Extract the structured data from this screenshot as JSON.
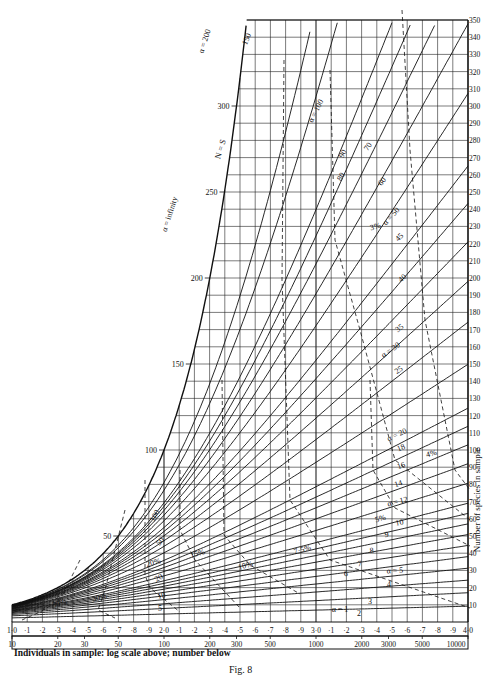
{
  "chart_data": {
    "type": "line",
    "title": "Fig. 8",
    "xlabel": "Individuals in sample: log scale above; number below",
    "ylabel": "Number of species in sample",
    "x_log_ticks": [
      "1·0",
      "·1",
      "·2",
      "·3",
      "·4",
      "·5",
      "·6",
      "·7",
      "·8",
      "·9",
      "2·0",
      "·1",
      "·2",
      "·3",
      "·4",
      "·5",
      "·6",
      "·7",
      "·8",
      "·9",
      "3·0",
      "·1",
      "·2",
      "·3",
      "·4",
      "·5",
      "·6",
      "·7",
      "·8",
      "·9",
      "4·0"
    ],
    "x_number_ticks": [
      10,
      20,
      30,
      50,
      100,
      200,
      300,
      500,
      1000,
      2000,
      3000,
      5000,
      10000
    ],
    "y_ticks_right": [
      10,
      20,
      30,
      40,
      50,
      60,
      70,
      80,
      90,
      100,
      110,
      120,
      130,
      140,
      150,
      160,
      170,
      180,
      190,
      200,
      210,
      220,
      230,
      240,
      250,
      260,
      270,
      280,
      290,
      300,
      310,
      320,
      330,
      340,
      350
    ],
    "y_ticks_left": [
      50,
      100,
      150,
      200,
      250,
      300
    ],
    "xlim_log": [
      1.0,
      4.0
    ],
    "ylim": [
      0,
      350
    ],
    "grid": true,
    "series": [
      {
        "name": "N = S",
        "alpha": "infinity"
      },
      {
        "name": "α = 200",
        "alpha": 200
      },
      {
        "name": "150",
        "alpha": 150
      },
      {
        "name": "α = 100",
        "alpha": 100
      },
      {
        "name": "90",
        "alpha": 90
      },
      {
        "name": "80",
        "alpha": 80
      },
      {
        "name": "70",
        "alpha": 70
      },
      {
        "name": "60",
        "alpha": 60
      },
      {
        "name": "α = 50",
        "alpha": 50
      },
      {
        "name": "45",
        "alpha": 45
      },
      {
        "name": "40",
        "alpha": 40
      },
      {
        "name": "35",
        "alpha": 35
      },
      {
        "name": "α = 30",
        "alpha": 30
      },
      {
        "name": "25",
        "alpha": 25
      },
      {
        "name": "α = 20",
        "alpha": 20
      },
      {
        "name": "18",
        "alpha": 18
      },
      {
        "name": "16",
        "alpha": 16
      },
      {
        "name": "14",
        "alpha": 14
      },
      {
        "name": "α = 12",
        "alpha": 12
      },
      {
        "name": "10",
        "alpha": 10
      },
      {
        "name": "9",
        "alpha": 9
      },
      {
        "name": "8",
        "alpha": 8
      },
      {
        "name": "7",
        "alpha": 7
      },
      {
        "name": "6",
        "alpha": 6
      },
      {
        "name": "α = 5",
        "alpha": 5
      },
      {
        "name": "4",
        "alpha": 4
      },
      {
        "name": "3",
        "alpha": 3
      },
      {
        "name": "2",
        "alpha": 2
      },
      {
        "name": "α = 1",
        "alpha": 1
      }
    ],
    "dashed_contours": [
      "3%",
      "4%",
      "5%",
      "7·5%",
      "10%",
      "15%",
      "20%",
      "30%",
      "50%"
    ],
    "annotations": [
      "α = infinity",
      "N = S",
      "100",
      "50",
      "20",
      "10",
      "5"
    ]
  },
  "labels": {
    "xlabel": "Individuals in sample: log scale above; number below",
    "fig": "Fig. 8",
    "ylabel": "Number of species in sample"
  }
}
